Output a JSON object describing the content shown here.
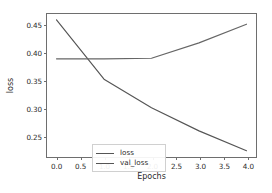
{
  "chart_data": {
    "type": "line",
    "title": "",
    "xlabel": "Epochs",
    "ylabel": "loss",
    "x": [
      0,
      1,
      2,
      3,
      4
    ],
    "xlim": [
      -0.2,
      4.2
    ],
    "ylim": [
      0.2105,
      0.4705
    ],
    "xticks": [
      "0.0",
      "0.5",
      "1.0",
      "1.5",
      "2.0",
      "2.5",
      "3.0",
      "3.5",
      "4.0"
    ],
    "xtick_values": [
      0.0,
      0.5,
      1.0,
      1.5,
      2.0,
      2.5,
      3.0,
      3.5,
      4.0
    ],
    "yticks": [
      "0.25",
      "0.30",
      "0.35",
      "0.40",
      "0.45"
    ],
    "ytick_values": [
      0.25,
      0.3,
      0.35,
      0.4,
      0.45
    ],
    "grid": false,
    "legend_position": "lower left",
    "series": [
      {
        "name": "loss",
        "color": "#555555",
        "values": [
          0.46,
          0.352,
          0.3,
          0.258,
          0.222
        ]
      },
      {
        "name": "val_loss",
        "color": "#666666",
        "values": [
          0.389,
          0.389,
          0.39,
          0.418,
          0.452
        ]
      }
    ]
  },
  "legend": {
    "entries": [
      {
        "label": "loss"
      },
      {
        "label": "val_loss"
      }
    ]
  },
  "colors": {
    "background": "#ffffff",
    "axis": "#6e6e6e",
    "text": "#2b2b2b",
    "legend_border": "#d0d0d0"
  }
}
